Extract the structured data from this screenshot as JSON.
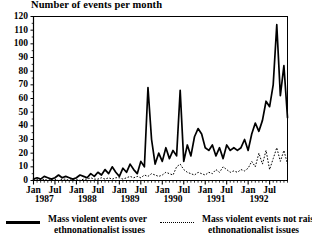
{
  "chart_data": {
    "type": "line",
    "title": "Number of events per month",
    "xlabel": "",
    "ylabel": "",
    "ylim": [
      0,
      120
    ],
    "ytick_step": 10,
    "yticks": [
      120,
      110,
      100,
      90,
      80,
      70,
      60,
      50,
      40,
      30,
      20,
      10,
      0
    ],
    "grid": false,
    "legend_position": "below",
    "x_start": "Jan 1987",
    "x_end": "Dec 1992",
    "x_tick_labels": [
      "Jan",
      "Jul",
      "Jan",
      "Jul",
      "Jan",
      "Jul",
      "Jan",
      "Jul",
      "Jan",
      "Jul",
      "Jan",
      "Jul"
    ],
    "x_year_labels": [
      "1987",
      "1988",
      "1989",
      "1990",
      "1991",
      "1992"
    ],
    "x_minor_ticks": "monthly",
    "series": [
      {
        "name": "Mass violent events over ethnonationalist issues",
        "style": "solid",
        "color": "#000000",
        "values": [
          1,
          2,
          1,
          3,
          2,
          1,
          2,
          4,
          2,
          3,
          2,
          1,
          2,
          4,
          3,
          2,
          5,
          3,
          6,
          4,
          8,
          5,
          10,
          6,
          3,
          9,
          6,
          12,
          8,
          5,
          14,
          10,
          68,
          30,
          12,
          20,
          14,
          24,
          16,
          22,
          18,
          66,
          14,
          26,
          18,
          32,
          38,
          34,
          24,
          22,
          26,
          18,
          24,
          16,
          26,
          22,
          24,
          22,
          24,
          30,
          22,
          34,
          42,
          36,
          44,
          58,
          54,
          70,
          114,
          62,
          84,
          46
        ]
      },
      {
        "name": "Mass violent events not raising ethnonationalist issues",
        "style": "dotted",
        "color": "#000000",
        "values": [
          0,
          1,
          0,
          1,
          0,
          1,
          1,
          0,
          1,
          1,
          0,
          1,
          1,
          0,
          1,
          1,
          2,
          1,
          1,
          2,
          1,
          2,
          1,
          2,
          2,
          1,
          2,
          3,
          2,
          3,
          2,
          4,
          3,
          5,
          4,
          3,
          4,
          6,
          5,
          4,
          10,
          12,
          8,
          6,
          5,
          4,
          6,
          5,
          4,
          6,
          5,
          8,
          6,
          10,
          8,
          6,
          7,
          6,
          8,
          7,
          9,
          14,
          10,
          20,
          12,
          22,
          8,
          16,
          24,
          14,
          22,
          12
        ]
      }
    ]
  },
  "legend": {
    "entries": [
      {
        "line1": "Mass violent events over",
        "line2": "ethnonationalist issues",
        "style": "solid"
      },
      {
        "line1": "Mass violent events not raising",
        "line2": "ethnonationalist issues",
        "style": "dotted"
      }
    ]
  }
}
